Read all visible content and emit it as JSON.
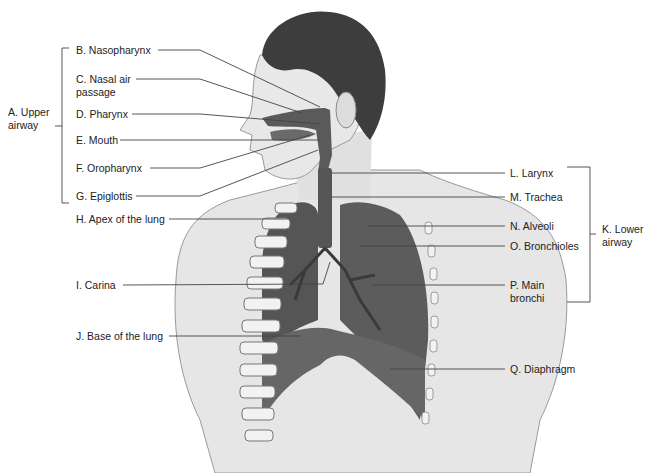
{
  "figure": {
    "colors": {
      "line": "#444444",
      "organ": "#5a5a5a",
      "skin": "#e4e4e4",
      "hair": "#3a3a3a",
      "rib": "#f4f4f4"
    }
  },
  "groups": {
    "upper": {
      "label": "A. Upper airway",
      "line1": "A. Upper",
      "line2": "airway"
    },
    "lower": {
      "label": "K. Lower airway",
      "line1": "K. Lower",
      "line2": "airway"
    }
  },
  "labels": {
    "B": {
      "text": "B. Nasopharynx"
    },
    "C": {
      "line1": "C. Nasal air",
      "line2": "passage"
    },
    "D": {
      "text": "D. Pharynx"
    },
    "E": {
      "text": "E. Mouth"
    },
    "F": {
      "text": "F. Oropharynx"
    },
    "G": {
      "text": "G. Epiglottis"
    },
    "H": {
      "text": "H. Apex of the lung"
    },
    "I": {
      "text": "I. Carina"
    },
    "J": {
      "text": "J. Base of the lung"
    },
    "L": {
      "text": "L. Larynx"
    },
    "M": {
      "text": "M. Trachea"
    },
    "N": {
      "text": "N. Alveoli"
    },
    "O": {
      "text": "O. Bronchioles"
    },
    "P": {
      "line1": "P. Main",
      "line2": "bronchi"
    },
    "Q": {
      "text": "Q. Diaphragm"
    }
  }
}
